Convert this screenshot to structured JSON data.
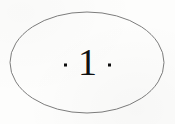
{
  "figure": {
    "kind": "page-number-ornament",
    "canvas": {
      "width": 175,
      "height": 124,
      "background_color": "#fdfdfc"
    },
    "ellipse": {
      "name": "outline-ellipse",
      "center_x": 87,
      "center_y": 62.5,
      "radius_x": 77,
      "radius_y": 50.5,
      "stroke_color": "#7d7d7d",
      "stroke_width": 1,
      "fill": "none"
    },
    "ornament": {
      "label": "·1·",
      "number": "1",
      "left_dot": "·",
      "right_dot": "·",
      "text_color": "#111111",
      "dot_color": "#0d0d0d"
    }
  }
}
